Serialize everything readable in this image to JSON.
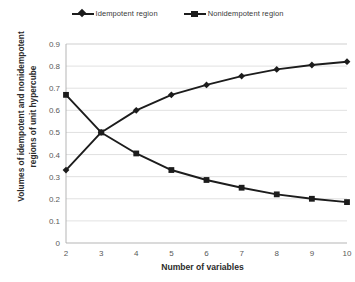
{
  "chart_data": {
    "type": "line",
    "title": "",
    "xlabel": "Number of variables",
    "ylabel": "Volumes of idempotent and nonidempotent regions of unit hypercube",
    "x": [
      2,
      3,
      4,
      5,
      6,
      7,
      8,
      9,
      10
    ],
    "xlim": [
      2,
      10
    ],
    "ylim": [
      0,
      0.9
    ],
    "xticks": [
      "2",
      "3",
      "4",
      "5",
      "6",
      "7",
      "8",
      "9",
      "10"
    ],
    "yticks": [
      "0",
      "0.1",
      "0.2",
      "0.3",
      "0.4",
      "0.5",
      "0.6",
      "0.7",
      "0.8",
      "0.9"
    ],
    "grid": "horizontal",
    "legend_position": "top-center",
    "series": [
      {
        "name": "Idempotent region",
        "marker": "diamond",
        "color": "#1c1c1c",
        "values": [
          0.33,
          0.5,
          0.6,
          0.67,
          0.715,
          0.755,
          0.785,
          0.805,
          0.82
        ]
      },
      {
        "name": "Nonidempotent region",
        "marker": "square",
        "color": "#1c1c1c",
        "values": [
          0.67,
          0.5,
          0.405,
          0.33,
          0.285,
          0.25,
          0.22,
          0.2,
          0.185
        ]
      }
    ]
  },
  "axis": {
    "y_title": "Volumes of idempotent and nonidempotent regions of unit hypercube",
    "x_title": "Number of variables"
  }
}
